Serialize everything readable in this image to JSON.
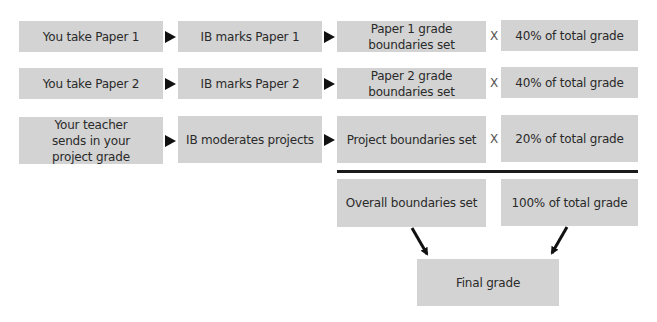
{
  "rows": [
    {
      "step1": "You take Paper 1",
      "step2": "IB marks Paper 1",
      "step3": "Paper 1 grade boundaries set",
      "operator": "X",
      "weight": "40% of total grade"
    },
    {
      "step1": "You take Paper 2",
      "step2": "IB marks Paper 2",
      "step3": "Paper 2 grade boundaries set",
      "operator": "X",
      "weight": "40% of total grade"
    },
    {
      "step1": "Your teacher sends in your project grade",
      "step2": "IB moderates projects",
      "step3": "Project boundaries set",
      "operator": "X",
      "weight": "20% of total grade"
    }
  ],
  "summary": {
    "overall": "Overall boundaries set",
    "total": "100% of total grade",
    "final": "Final grade"
  },
  "colors": {
    "box_fill": "#d3d3d3",
    "arrow": "#111111",
    "text": "#2a2a2a"
  }
}
